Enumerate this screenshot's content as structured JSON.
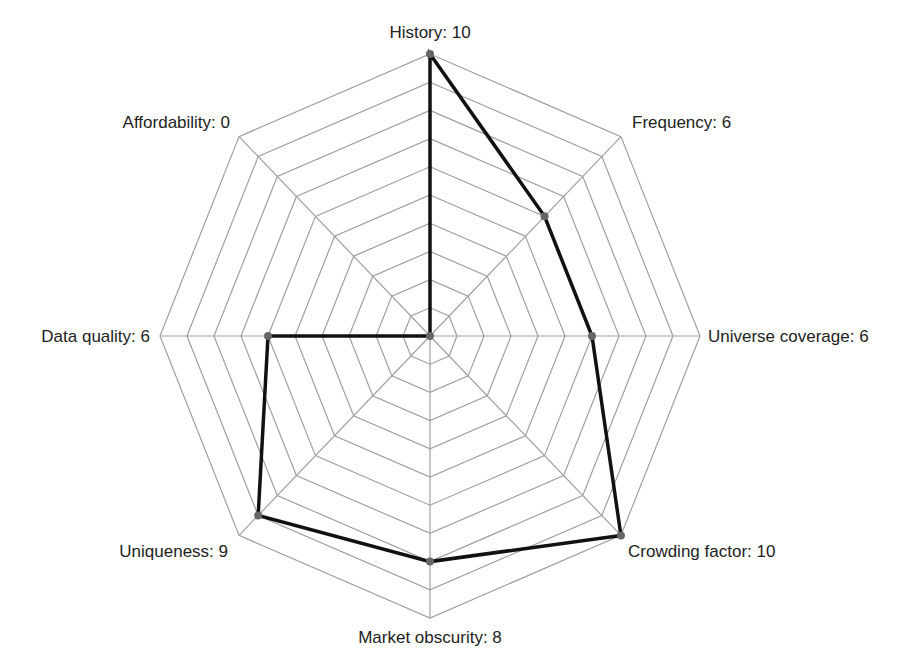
{
  "chart_data": {
    "type": "radar",
    "title": "",
    "axes": [
      "History",
      "Frequency",
      "Universe coverage",
      "Crowding factor",
      "Market obscurity",
      "Uniqueness",
      "Data quality",
      "Affordability"
    ],
    "values": [
      10,
      6,
      6,
      10,
      8,
      9,
      6,
      0
    ],
    "labels": [
      "History: 10",
      "Frequency: 6",
      "Universe coverage: 6",
      "Crowding factor: 10",
      "Market obscurity: 8",
      "Uniqueness: 9",
      "Data quality: 6",
      "Affordability: 0"
    ],
    "range": [
      0,
      10
    ],
    "rings": 10,
    "grid": true,
    "legend": "none"
  },
  "colors": {
    "grid": "#a0a0a0",
    "series_line": "#111111",
    "marker": "#666666",
    "label_text": "#222222",
    "background": "#ffffff"
  }
}
